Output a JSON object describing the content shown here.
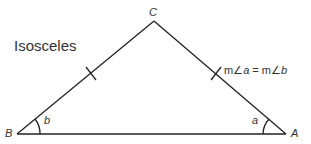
{
  "title": "Isosceles",
  "vertices": {
    "A": "A",
    "B": "B",
    "C": "C"
  },
  "angles": {
    "a": "a",
    "b": "b"
  },
  "relation": {
    "prefix1": "m∠",
    "var1": "a",
    "eq": " = m∠",
    "var2": "b"
  },
  "colors": {
    "stroke": "#222222"
  }
}
